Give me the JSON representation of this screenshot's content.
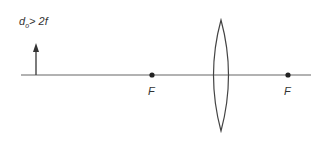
{
  "diagram": {
    "condition_label": {
      "main": "d",
      "subscript": "o",
      "rest": "> 2f"
    },
    "focal_points": [
      {
        "label": "F",
        "position": "left"
      },
      {
        "label": "F",
        "position": "right"
      }
    ],
    "elements": {
      "optical_axis": "horizontal principal axis",
      "object": "upright arrow",
      "lens": "biconvex converging lens"
    },
    "colors": {
      "line": "#555555",
      "text": "#333333",
      "background": "#ffffff"
    }
  }
}
